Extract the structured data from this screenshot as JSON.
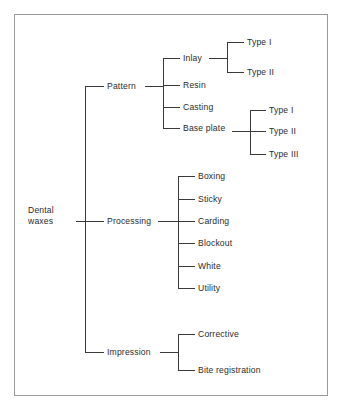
{
  "figure": {
    "kind": "hierarchy-tree-diagram",
    "frame_color": "#9a9a9a",
    "line_color": "#3a3a3a",
    "text_color": "#2b2b2b",
    "background": "#ffffff"
  },
  "tree": {
    "root": {
      "label_line1": "Dental",
      "label_line2": "waxes"
    },
    "branches": [
      {
        "key": "pattern",
        "label": "Pattern",
        "children": [
          {
            "key": "inlay",
            "label": "Inlay",
            "children": [
              {
                "key": "inlay-type-1",
                "label": "Type I"
              },
              {
                "key": "inlay-type-2",
                "label": "Type II"
              }
            ]
          },
          {
            "key": "resin",
            "label": "Resin",
            "children": []
          },
          {
            "key": "casting",
            "label": "Casting",
            "children": []
          },
          {
            "key": "base-plate",
            "label": "Base plate",
            "children": [
              {
                "key": "base-plate-type-1",
                "label": "Type I"
              },
              {
                "key": "base-plate-type-2",
                "label": "Type II"
              },
              {
                "key": "base-plate-type-3",
                "label": "Type III"
              }
            ]
          }
        ]
      },
      {
        "key": "processing",
        "label": "Processing",
        "children": [
          {
            "key": "boxing",
            "label": "Boxing",
            "children": []
          },
          {
            "key": "sticky",
            "label": "Sticky",
            "children": []
          },
          {
            "key": "carding",
            "label": "Carding",
            "children": []
          },
          {
            "key": "blockout",
            "label": "Blockout",
            "children": []
          },
          {
            "key": "white",
            "label": "White",
            "children": []
          },
          {
            "key": "utility",
            "label": "Utility",
            "children": []
          }
        ]
      },
      {
        "key": "impression",
        "label": "Impression",
        "children": [
          {
            "key": "corrective",
            "label": "Corrective",
            "children": []
          },
          {
            "key": "bite-registration",
            "label": "Bite registration",
            "children": []
          }
        ]
      }
    ]
  }
}
